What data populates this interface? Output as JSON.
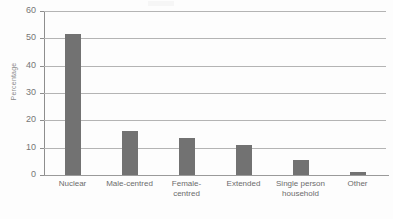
{
  "chart_data": {
    "type": "bar",
    "title": "",
    "xlabel": "",
    "ylabel": "Percentage",
    "ylim": [
      0,
      60
    ],
    "yticks": [
      0,
      10,
      20,
      30,
      40,
      50,
      60
    ],
    "grid": true,
    "legend": "none",
    "bar_color": "#727272",
    "categories": [
      "Nuclear",
      "Male-centred",
      "Female-centred",
      "Extended",
      "Single person household",
      "Other"
    ],
    "category_lines": [
      [
        "Nuclear"
      ],
      [
        "Male-centred"
      ],
      [
        "Female-",
        "centred"
      ],
      [
        "Extended"
      ],
      [
        "Single person",
        "household"
      ],
      [
        "Other"
      ]
    ],
    "values": [
      51.5,
      16,
      13.5,
      11,
      5.5,
      1
    ]
  },
  "axis": {
    "y_title": "Percentage",
    "y_tick_labels": [
      "60",
      "50",
      "40",
      "30",
      "20",
      "10",
      "0"
    ]
  }
}
